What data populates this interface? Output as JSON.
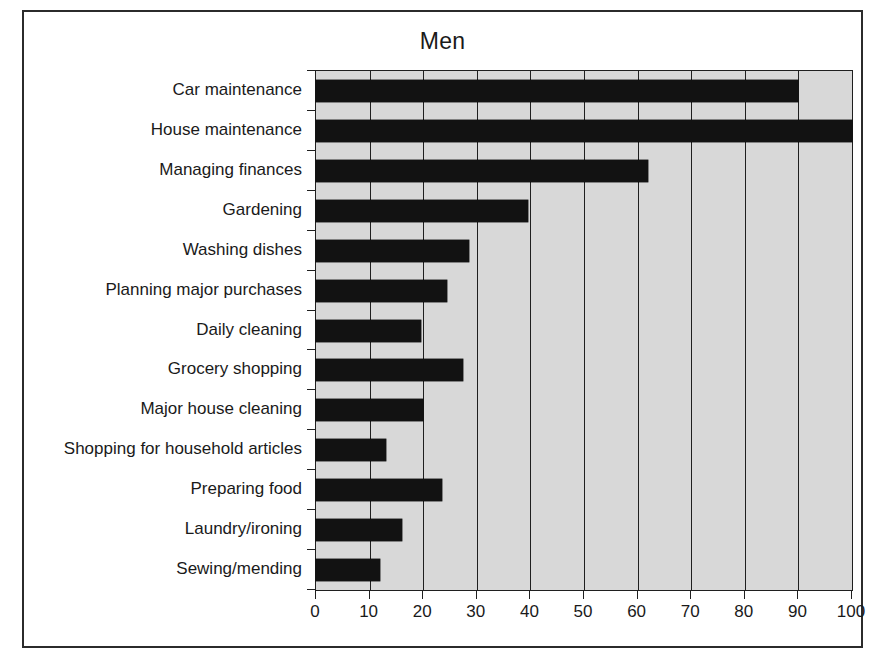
{
  "figure": {
    "title": "Men",
    "frame_color": "#2b2b2b",
    "plot_background": "#d8d8d8",
    "bar_color": "#121212",
    "axis_color": "#1f1f1f"
  },
  "chart_data": {
    "type": "bar",
    "orientation": "horizontal",
    "title": "Men",
    "xlabel": "",
    "ylabel": "",
    "xlim": [
      0,
      100
    ],
    "xticks": [
      0,
      10,
      20,
      30,
      40,
      50,
      60,
      70,
      80,
      90,
      100
    ],
    "grid": true,
    "legend": null,
    "categories": [
      "Car maintenance",
      "House maintenance",
      "Managing finances",
      "Gardening",
      "Washing dishes",
      "Planning major purchases",
      "Daily cleaning",
      "Grocery shopping",
      "Major house cleaning",
      "Shopping for household articles",
      "Preparing food",
      "Laundry/ironing",
      "Sewing/mending"
    ],
    "values": [
      90,
      100,
      62,
      39.5,
      28.5,
      24.5,
      19.5,
      27.5,
      20,
      13,
      23.5,
      16,
      12
    ]
  }
}
